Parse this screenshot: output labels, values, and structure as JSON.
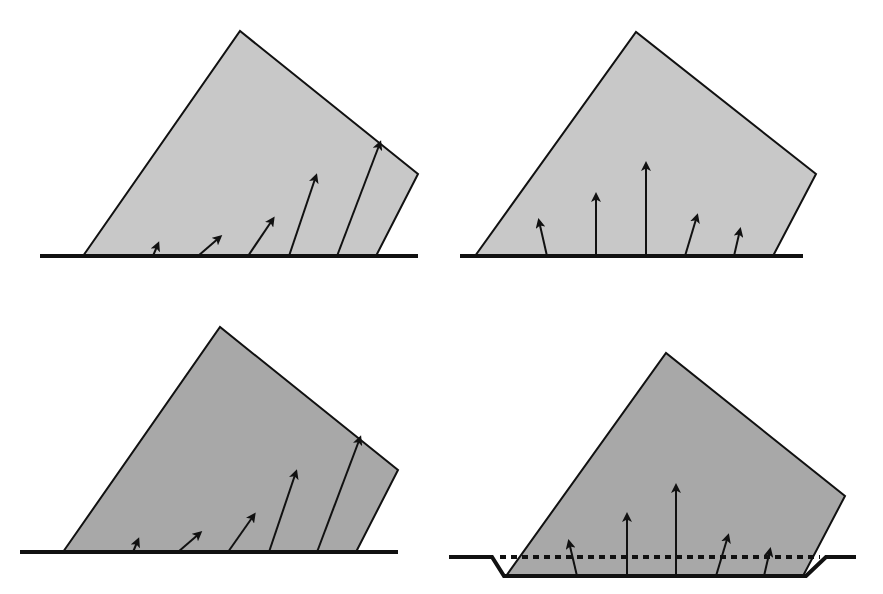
{
  "figure": {
    "width": 883,
    "height": 594,
    "background": "#ffffff",
    "stroke_color": "#111111",
    "panels": [
      {
        "id": "panel-top-left",
        "fill": "#c8c8c8",
        "ground": {
          "points": [
            [
              40,
              256
            ],
            [
              418,
              256
            ]
          ],
          "width": 4
        },
        "block": {
          "points": [
            [
              83,
              256
            ],
            [
              240,
              31
            ],
            [
              418,
              174
            ],
            [
              376,
              256
            ]
          ]
        },
        "arrows": [
          {
            "from": [
              153,
              256
            ],
            "to": [
              158,
              244
            ]
          },
          {
            "from": [
              198,
              256
            ],
            "to": [
              220,
              237
            ]
          },
          {
            "from": [
              248,
              256
            ],
            "to": [
              273,
              219
            ]
          },
          {
            "from": [
              289,
              256
            ],
            "to": [
              316,
              176
            ]
          },
          {
            "from": [
              337,
              256
            ],
            "to": [
              380,
              143
            ]
          }
        ]
      },
      {
        "id": "panel-top-right",
        "fill": "#c8c8c8",
        "ground": {
          "points": [
            [
              460,
              256
            ],
            [
              803,
              256
            ]
          ],
          "width": 4
        },
        "block": {
          "points": [
            [
              475,
              256
            ],
            [
              636,
              32
            ],
            [
              816,
              174
            ],
            [
              773,
              256
            ]
          ]
        },
        "arrows": [
          {
            "from": [
              547,
              256
            ],
            "to": [
              539,
              221
            ]
          },
          {
            "from": [
              596,
              256
            ],
            "to": [
              596,
              195
            ]
          },
          {
            "from": [
              646,
              256
            ],
            "to": [
              646,
              164
            ]
          },
          {
            "from": [
              685,
              256
            ],
            "to": [
              697,
              216
            ]
          },
          {
            "from": [
              734,
              256
            ],
            "to": [
              740,
              230
            ]
          }
        ]
      },
      {
        "id": "panel-bottom-left",
        "fill": "#a8a8a8",
        "ground": {
          "points": [
            [
              20,
              552
            ],
            [
              398,
              552
            ]
          ],
          "width": 4
        },
        "block": {
          "points": [
            [
              63,
              552
            ],
            [
              220,
              327
            ],
            [
              398,
              470
            ],
            [
              356,
              552
            ]
          ]
        },
        "arrows": [
          {
            "from": [
              133,
              552
            ],
            "to": [
              138,
              540
            ]
          },
          {
            "from": [
              178,
              552
            ],
            "to": [
              200,
              533
            ]
          },
          {
            "from": [
              228,
              552
            ],
            "to": [
              254,
              515
            ]
          },
          {
            "from": [
              269,
              552
            ],
            "to": [
              296,
              472
            ]
          },
          {
            "from": [
              317,
              552
            ],
            "to": [
              360,
              438
            ]
          }
        ]
      },
      {
        "id": "panel-bottom-right",
        "fill": "#a8a8a8",
        "ground": {
          "points": [
            [
              449,
              557
            ],
            [
              492,
              557
            ],
            [
              504,
              576
            ],
            [
              806,
              576
            ],
            [
              826,
              557
            ],
            [
              856,
              557
            ]
          ],
          "width": 4
        },
        "water_line": {
          "from": [
            500,
            557
          ],
          "to": [
            820,
            557
          ],
          "dash": "6 5",
          "width": 4
        },
        "block": {
          "points": [
            [
              506,
              576
            ],
            [
              666,
              353
            ],
            [
              845,
              496
            ],
            [
              803,
              576
            ]
          ]
        },
        "arrows": [
          {
            "from": [
              577,
              576
            ],
            "to": [
              569,
              542
            ]
          },
          {
            "from": [
              627,
              576
            ],
            "to": [
              627,
              515
            ]
          },
          {
            "from": [
              676,
              576
            ],
            "to": [
              676,
              486
            ]
          },
          {
            "from": [
              716,
              576
            ],
            "to": [
              728,
              536
            ]
          },
          {
            "from": [
              764,
              576
            ],
            "to": [
              770,
              550
            ]
          }
        ]
      }
    ]
  }
}
